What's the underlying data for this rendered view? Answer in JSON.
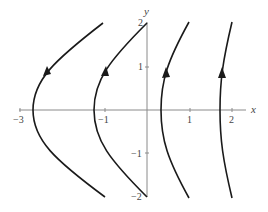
{
  "diagram": {
    "type": "phase-portrait",
    "axes": {
      "x_label": "x",
      "y_label": "y",
      "x_ticks": [
        {
          "value": -3,
          "label": "−3"
        },
        {
          "value": -1,
          "label": "−1"
        },
        {
          "value": 1,
          "label": "1"
        },
        {
          "value": 2,
          "label": "2"
        }
      ],
      "y_ticks": [
        {
          "value": 2,
          "label": "2"
        },
        {
          "value": 1,
          "label": "1"
        },
        {
          "value": -1,
          "label": "−1"
        },
        {
          "value": -2,
          "label": "−2"
        }
      ],
      "x_range": [
        -3,
        2.3
      ],
      "y_range": [
        -2,
        2
      ]
    },
    "trajectories": [
      {
        "name": "trajectory-1",
        "vertex_x": -2.68,
        "end_x_at_y_pm2": -1.04,
        "direction": "upward"
      },
      {
        "name": "trajectory-2",
        "vertex_x": -1.25,
        "end_x_at_y_pm2": 0.0,
        "direction": "upward"
      },
      {
        "name": "trajectory-3",
        "vertex_x": 0.33,
        "end_x_at_y_pm2": 1.0,
        "direction": "upward"
      },
      {
        "name": "trajectory-4",
        "vertex_x": 1.72,
        "end_x_at_y_pm2": 2.0,
        "direction": "upward"
      }
    ],
    "colors": {
      "curve": "#1a1a1a",
      "axis": "#8a8a8a",
      "text": "#444444"
    }
  }
}
